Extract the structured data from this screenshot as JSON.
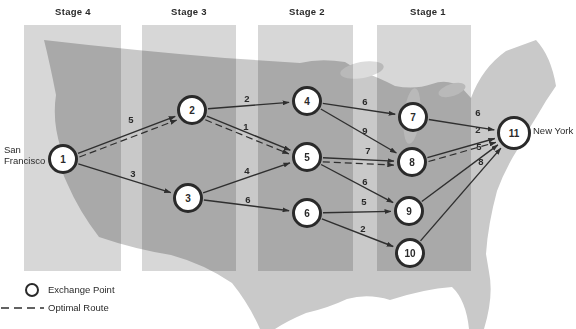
{
  "figure": {
    "origin_city": "San Francisco",
    "destination_city": "New York"
  },
  "stages": [
    {
      "label": "Stage 4"
    },
    {
      "label": "Stage 3"
    },
    {
      "label": "Stage 2"
    },
    {
      "label": "Stage 1"
    }
  ],
  "graph": {
    "nodes": [
      {
        "id": "1"
      },
      {
        "id": "2"
      },
      {
        "id": "3"
      },
      {
        "id": "4"
      },
      {
        "id": "5"
      },
      {
        "id": "6"
      },
      {
        "id": "7"
      },
      {
        "id": "8"
      },
      {
        "id": "9"
      },
      {
        "id": "10"
      },
      {
        "id": "11"
      }
    ],
    "edges": [
      {
        "from": 1,
        "to": 2,
        "weight": "5"
      },
      {
        "from": 1,
        "to": 3,
        "weight": "3"
      },
      {
        "from": 2,
        "to": 4,
        "weight": "2"
      },
      {
        "from": 2,
        "to": 5,
        "weight": "1"
      },
      {
        "from": 3,
        "to": 5,
        "weight": "4"
      },
      {
        "from": 3,
        "to": 6,
        "weight": "6"
      },
      {
        "from": 4,
        "to": 7,
        "weight": "6"
      },
      {
        "from": 4,
        "to": 8,
        "weight": "9"
      },
      {
        "from": 5,
        "to": 8,
        "weight": "7"
      },
      {
        "from": 5,
        "to": 9,
        "weight": "6"
      },
      {
        "from": 6,
        "to": 9,
        "weight": "5"
      },
      {
        "from": 6,
        "to": 10,
        "weight": "2"
      },
      {
        "from": 7,
        "to": 11,
        "weight": "6"
      },
      {
        "from": 8,
        "to": 11,
        "weight": "2"
      },
      {
        "from": 9,
        "to": 11,
        "weight": "5"
      },
      {
        "from": 10,
        "to": 11,
        "weight": "8"
      }
    ],
    "optimal_route": [
      1,
      2,
      5,
      8,
      11
    ]
  },
  "legend": {
    "exchange_point": "Exchange Point",
    "optimal_route": "Optimal Route"
  },
  "colors": {
    "map_gray": "#c9c9c9",
    "stage_band_gray": "#d7d7d7",
    "line_dark": "#2f2f2f"
  }
}
